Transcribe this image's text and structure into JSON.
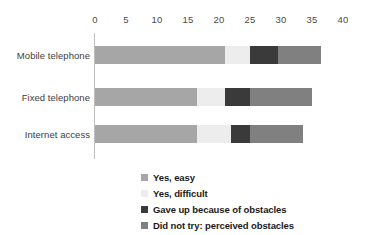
{
  "chart_data": {
    "type": "bar",
    "orientation": "horizontal",
    "stacked": true,
    "title": "",
    "xlabel": "",
    "ylabel": "",
    "xlim": [
      0,
      40
    ],
    "xticks": [
      0,
      5,
      10,
      15,
      20,
      25,
      30,
      35,
      40
    ],
    "grid": false,
    "legend_position": "bottom",
    "categories": [
      "Mobile telephone",
      "Fixed telephone",
      "Internet access"
    ],
    "series": [
      {
        "name": "Yes, easy",
        "color": "#a6a6a6",
        "values": [
          21.0,
          16.5,
          16.5
        ]
      },
      {
        "name": "Yes, difficult",
        "color": "#ededed",
        "values": [
          4.0,
          4.5,
          5.5
        ]
      },
      {
        "name": "Gave up because of obstacles",
        "color": "#3a3a3a",
        "values": [
          4.5,
          4.0,
          3.0
        ]
      },
      {
        "name": "Did not try: perceived obstacles",
        "color": "#808080",
        "values": [
          7.0,
          10.0,
          8.5
        ]
      }
    ],
    "totals": [
      36.5,
      35.0,
      33.5
    ]
  },
  "axis": {
    "tick_labels": [
      "0",
      "5",
      "10",
      "15",
      "20",
      "25",
      "30",
      "35",
      "40"
    ]
  },
  "category_labels": [
    "Mobile telephone",
    "Fixed telephone",
    "Internet access"
  ],
  "legend": {
    "items": [
      {
        "label": "Yes, easy",
        "color": "#a6a6a6"
      },
      {
        "label": "Yes, difficult",
        "color": "#ededed"
      },
      {
        "label": "Gave up because of obstacles",
        "color": "#3a3a3a"
      },
      {
        "label": "Did not try: perceived obstacles",
        "color": "#808080"
      }
    ]
  },
  "colors": {
    "axis_line": "#bfbfbf",
    "tick_text": "#4a4a4a",
    "category_text": "#3d3d3d",
    "legend_text": "#1a1a1a",
    "background": "#ffffff"
  }
}
